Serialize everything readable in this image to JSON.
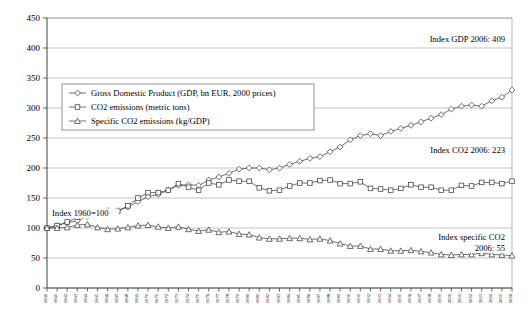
{
  "chart_data": {
    "type": "line",
    "title": "",
    "subtitle": "",
    "xlabel": "",
    "ylabel": "",
    "ylim": [
      0,
      450
    ],
    "ytick_step": 50,
    "yticks": [
      "0",
      "50",
      "100",
      "150",
      "200",
      "250",
      "300",
      "350",
      "400",
      "450"
    ],
    "grid": true,
    "legend_position": "upper-left-inside",
    "baseline_note": "Index 1960=100",
    "x": [
      1960,
      1961,
      1962,
      1963,
      1964,
      1965,
      1966,
      1967,
      1968,
      1969,
      1970,
      1971,
      1972,
      1973,
      1974,
      1975,
      1976,
      1977,
      1978,
      1979,
      1980,
      1981,
      1982,
      1983,
      1984,
      1985,
      1986,
      1987,
      1988,
      1989,
      1990,
      1991,
      1992,
      1993,
      1994,
      1995,
      1996,
      1997,
      1998,
      1999,
      2000,
      2001,
      2002,
      2003,
      2004,
      2005,
      2006
    ],
    "xtick_labels": [
      "1960",
      "1961",
      "1962",
      "1963",
      "1964",
      "1965",
      "1966",
      "1967",
      "1968",
      "1969",
      "1970",
      "1971",
      "1972",
      "1973",
      "1974",
      "1975",
      "1976",
      "1977",
      "1978",
      "1979",
      "1980",
      "1981",
      "1982",
      "1983",
      "1984",
      "1985",
      "1986",
      "1987",
      "1988",
      "1989",
      "1990",
      "1991",
      "1992",
      "1993",
      "1994",
      "1995",
      "1996",
      "1997",
      "1998",
      "1999",
      "2000",
      "2001",
      "2002",
      "2003",
      "2004",
      "2005",
      "2006"
    ],
    "series": [
      {
        "name": "Gross Domestic Product (GDP, bn EUR, 2000 prices)",
        "marker": "diamond",
        "values": [
          100,
          104,
          109,
          112,
          119,
          125,
          129,
          129,
          135,
          144,
          152,
          156,
          163,
          171,
          172,
          171,
          180,
          185,
          191,
          198,
          200,
          200,
          197,
          200,
          206,
          211,
          216,
          219,
          227,
          235,
          247,
          254,
          257,
          254,
          261,
          266,
          271,
          277,
          283,
          289,
          298,
          303,
          305,
          303,
          312,
          318,
          330
        ]
      },
      {
        "name": "CO2 emissions (metric tons)",
        "marker": "square",
        "values": [
          100,
          104,
          110,
          118,
          126,
          126,
          127,
          128,
          137,
          150,
          159,
          159,
          163,
          174,
          168,
          163,
          175,
          172,
          180,
          178,
          178,
          167,
          162,
          163,
          170,
          175,
          175,
          179,
          180,
          174,
          174,
          177,
          166,
          165,
          163,
          166,
          172,
          168,
          168,
          163,
          163,
          171,
          170,
          176,
          176,
          174,
          178
        ]
      },
      {
        "name": "Specific CO2 emissions (kg/GDP)",
        "marker": "triangle",
        "values": [
          100,
          100,
          101,
          105,
          106,
          101,
          98,
          99,
          101,
          104,
          105,
          102,
          100,
          102,
          98,
          95,
          97,
          93,
          94,
          90,
          89,
          84,
          82,
          82,
          83,
          83,
          81,
          82,
          79,
          74,
          70,
          70,
          65,
          65,
          62,
          62,
          63,
          61,
          59,
          56,
          55,
          56,
          56,
          58,
          56,
          55,
          54
        ]
      }
    ],
    "annotations": [
      {
        "id": "gdp-annotation",
        "lines": [
          "Index GDP 2006: 409"
        ]
      },
      {
        "id": "co2-annotation",
        "lines": [
          "Index CO2 2006: 223"
        ]
      },
      {
        "id": "specific-co2-annotation",
        "lines": [
          "Index specific CO2",
          "2006: 55"
        ]
      },
      {
        "id": "baseline-annotation",
        "lines": [
          "Index 1960=100"
        ]
      }
    ],
    "endpoint_values": {
      "gdp_2006": 409,
      "co2_2006": 223,
      "specific_co2_2006": 55
    },
    "colors": {
      "line": "#404040",
      "grid": "#aaaaaa",
      "axis": "#555555",
      "marker_fill": "#ffffff",
      "background": "#ffffff"
    }
  }
}
